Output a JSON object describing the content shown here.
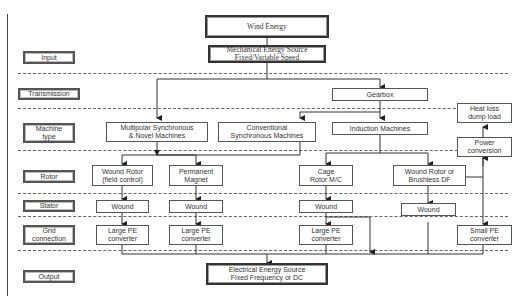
{
  "diagram": {
    "title": "Wind Energy",
    "source": [
      "Mechanical Energy Source",
      "Fixed/Variable Speed"
    ],
    "output": [
      "Electrical Energy Source",
      "Fixed Frequency or DC"
    ]
  },
  "row_labels": [
    {
      "id": "input",
      "text": "Input"
    },
    {
      "id": "transmission",
      "text": "Transmission"
    },
    {
      "id": "machine-type",
      "text": "Machine type"
    },
    {
      "id": "rotor",
      "text": "Rotor"
    },
    {
      "id": "stator",
      "text": "Stator"
    },
    {
      "id": "grid-connection",
      "text": "Grid connection"
    },
    {
      "id": "output",
      "text": "Output"
    }
  ],
  "transmission": {
    "gearbox": "Gearbox"
  },
  "machines": {
    "multipolar": [
      "Multipolar Synchronous",
      "& Novel Machines"
    ],
    "conventional": [
      "Conventional",
      "Synchronous Machines"
    ],
    "induction": "Induction Machines"
  },
  "rotors": {
    "wound_field": [
      "Wound Rotor",
      "(field control)"
    ],
    "permanent_magnet": [
      "Permanent",
      "Magnet"
    ],
    "cage": [
      "Cage",
      "Rotor M/C"
    ],
    "wound_brushless": [
      "Wound Rotor or",
      "Brushless DF"
    ]
  },
  "stators": {
    "s1": "Wound",
    "s2": "Wound",
    "s3": "Wound",
    "s4": "Wound"
  },
  "converters": {
    "c1": [
      "Large PE",
      "converter"
    ],
    "c2": [
      "Large PE",
      "converter"
    ],
    "c3": [
      "Large PE",
      "converter"
    ],
    "small": [
      "Small PE",
      "converter"
    ]
  },
  "aux": {
    "heat_loss": [
      "Heat loss",
      "dump load"
    ],
    "power_conversion": [
      "Power",
      "conversion"
    ]
  },
  "colors": {
    "line": "#333333",
    "box_border": "#555555",
    "background": "#ffffff"
  }
}
